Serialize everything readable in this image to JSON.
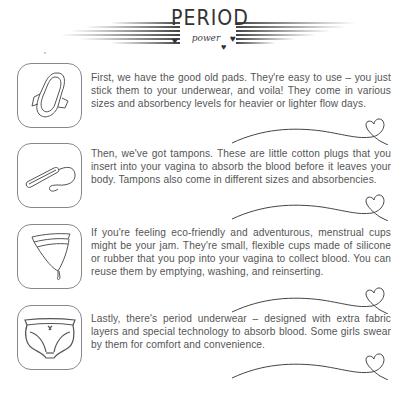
{
  "header": {
    "title": "PERIOD",
    "subtitle": "power"
  },
  "items": [
    {
      "icon": "pad-icon",
      "text": "First, we have the good old pads. They're easy to use – you just stick them to your underwear, and voila! They come in various sizes and absorbency levels for heavier or lighter flow days."
    },
    {
      "icon": "tampon-icon",
      "text": "Then, we've got tampons. These are little cotton plugs that you insert into your vagina to absorb the blood before it leaves your body. Tampons also come in different sizes and absorbencies."
    },
    {
      "icon": "menstrual-cup-icon",
      "text": "If you're feeling eco-friendly and adventurous, menstrual cups might be your jam. They're small, flexible cups made of silicone or rubber that you pop into your vagina to collect blood. You can reuse them by emptying, washing, and reinserting."
    },
    {
      "icon": "period-underwear-icon",
      "text": "Lastly, there's period underwear – designed with extra fabric layers and special technology to absorb blood. Some girls swear by them for comfort and convenience."
    }
  ],
  "colors": {
    "text": "#555555",
    "stroke": "#444444",
    "background": "#ffffff"
  }
}
